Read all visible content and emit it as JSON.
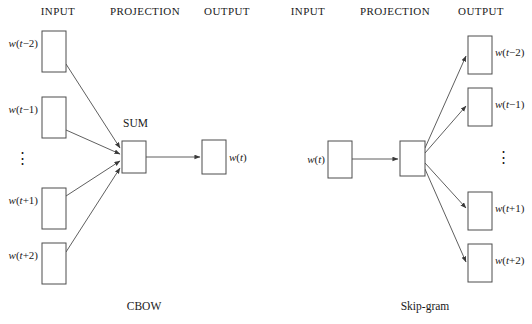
{
  "figure": {
    "background_color": "#ffffff",
    "stroke_color": "#4d4d4d",
    "text_color": "#1a1a1a",
    "width": 532,
    "height": 324
  },
  "panels": [
    {
      "id": "cbow",
      "caption": "CBOW",
      "caption_x": 144,
      "caption_y": 310,
      "headers": [
        {
          "label": "INPUT",
          "x": 58,
          "y": 15
        },
        {
          "label": "PROJECTION",
          "x": 145,
          "y": 15
        },
        {
          "label": "OUTPUT",
          "x": 227,
          "y": 15
        }
      ],
      "input_nodes": [
        {
          "label_prefix": "w(",
          "label_var": "t",
          "label_suffix": "−2)",
          "label_text": "w(t−2)",
          "x": 42,
          "y": 31,
          "w": 24,
          "h": 41,
          "label_x": 38,
          "label_y": 47
        },
        {
          "label_prefix": "w(",
          "label_var": "t",
          "label_suffix": "−1)",
          "label_text": "w(t−1)",
          "x": 42,
          "y": 97,
          "w": 24,
          "h": 41,
          "label_x": 38,
          "label_y": 113
        },
        {
          "label_prefix": "w(",
          "label_var": "t",
          "label_suffix": "+1)",
          "label_text": "w(t+1)",
          "x": 42,
          "y": 188,
          "w": 24,
          "h": 41,
          "label_x": 38,
          "label_y": 204
        },
        {
          "label_prefix": "w(",
          "label_var": "t",
          "label_suffix": "+2)",
          "label_text": "w(t+2)",
          "x": 42,
          "y": 243,
          "w": 24,
          "h": 41,
          "label_x": 38,
          "label_y": 259
        }
      ],
      "vertical_ellipsis": {
        "glyph": "⋮",
        "x": 22,
        "y": 163
      },
      "projection_node": {
        "x": 122,
        "y": 141,
        "w": 24,
        "h": 32,
        "sum_label": "SUM",
        "sum_label_x": 123,
        "sum_label_y": 127
      },
      "output_nodes": [
        {
          "label_prefix": "w(",
          "label_var": "t",
          "label_suffix": ")",
          "label_text": "w(t)",
          "x": 202,
          "y": 140,
          "w": 24,
          "h": 34,
          "label_x": 229,
          "label_y": 161
        }
      ],
      "edges": [
        {
          "from": "input-0",
          "to": "projection",
          "x1": 66,
          "y1": 64,
          "x2": 120,
          "y2": 148,
          "arrow": true
        },
        {
          "from": "input-1",
          "to": "projection",
          "x1": 66,
          "y1": 130,
          "x2": 120,
          "y2": 154,
          "arrow": true
        },
        {
          "from": "input-2",
          "to": "projection",
          "x1": 66,
          "y1": 196,
          "x2": 120,
          "y2": 161,
          "arrow": true
        },
        {
          "from": "input-3",
          "to": "projection",
          "x1": 66,
          "y1": 252,
          "x2": 120,
          "y2": 168,
          "arrow": true
        },
        {
          "from": "projection",
          "to": "output-0",
          "x1": 146,
          "y1": 157,
          "x2": 200,
          "y2": 157,
          "arrow": true
        }
      ]
    },
    {
      "id": "skip-gram",
      "caption": "Skip-gram",
      "caption_x": 425,
      "caption_y": 310,
      "headers": [
        {
          "label": "INPUT",
          "x": 308,
          "y": 15
        },
        {
          "label": "PROJECTION",
          "x": 395,
          "y": 15
        },
        {
          "label": "OUTPUT",
          "x": 481,
          "y": 15
        }
      ],
      "input_nodes": [
        {
          "label_prefix": "w(",
          "label_var": "t",
          "label_suffix": ")",
          "label_text": "w(t)",
          "x": 328,
          "y": 141,
          "w": 24,
          "h": 37,
          "label_x": 325,
          "label_y": 163
        }
      ],
      "vertical_ellipsis": {
        "glyph": "⋮",
        "x": 503,
        "y": 162
      },
      "projection_node": {
        "x": 400,
        "y": 141,
        "w": 25,
        "h": 35,
        "sum_label": "",
        "sum_label_x": 0,
        "sum_label_y": 0
      },
      "output_nodes": [
        {
          "label_prefix": "w(",
          "label_var": "t",
          "label_suffix": "−2)",
          "label_text": "w(t−2)",
          "x": 468,
          "y": 36,
          "w": 24,
          "h": 38,
          "label_x": 495,
          "label_y": 56
        },
        {
          "label_prefix": "w(",
          "label_var": "t",
          "label_suffix": "−1)",
          "label_text": "w(t−1)",
          "x": 468,
          "y": 88,
          "w": 24,
          "h": 38,
          "label_x": 495,
          "label_y": 108
        },
        {
          "label_prefix": "w(",
          "label_var": "t",
          "label_suffix": "+1)",
          "label_text": "w(t+1)",
          "x": 468,
          "y": 192,
          "w": 24,
          "h": 38,
          "label_x": 495,
          "label_y": 212
        },
        {
          "label_prefix": "w(",
          "label_var": "t",
          "label_suffix": "+2)",
          "label_text": "w(t+2)",
          "x": 468,
          "y": 244,
          "w": 24,
          "h": 38,
          "label_x": 495,
          "label_y": 264
        }
      ],
      "edges": [
        {
          "from": "input-0",
          "to": "projection",
          "x1": 352,
          "y1": 159,
          "x2": 398,
          "y2": 159,
          "arrow": true
        },
        {
          "from": "projection",
          "to": "output-0",
          "x1": 425,
          "y1": 148,
          "x2": 466,
          "y2": 56,
          "arrow": true
        },
        {
          "from": "projection",
          "to": "output-1",
          "x1": 425,
          "y1": 153,
          "x2": 466,
          "y2": 106,
          "arrow": true
        },
        {
          "from": "projection",
          "to": "output-2",
          "x1": 425,
          "y1": 163,
          "x2": 466,
          "y2": 208,
          "arrow": true
        },
        {
          "from": "projection",
          "to": "output-3",
          "x1": 425,
          "y1": 169,
          "x2": 466,
          "y2": 262,
          "arrow": true
        }
      ]
    }
  ]
}
